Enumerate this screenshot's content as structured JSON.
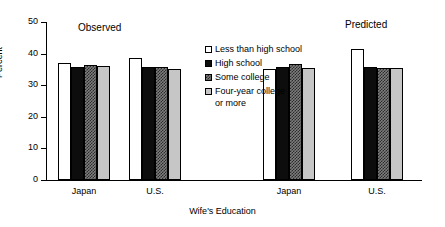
{
  "chart_data": {
    "type": "bar",
    "title": "",
    "xlabel": "Wife's Education",
    "ylabel": "Percent",
    "ylim": [
      0,
      50
    ],
    "yticks": [
      0,
      10,
      20,
      30,
      40,
      50
    ],
    "grid": false,
    "legend_position": "center-top-inside",
    "panels": [
      {
        "label": "Observed"
      },
      {
        "label": "Predicted"
      }
    ],
    "categories": [
      "Japan",
      "U.S.",
      "Japan",
      "U.S."
    ],
    "group_panels": [
      "Observed",
      "Observed",
      "Predicted",
      "Predicted"
    ],
    "series": [
      {
        "name": "Less than high school",
        "swatch": "white",
        "values": [
          37.0,
          38.6,
          35.1,
          41.6
        ]
      },
      {
        "name": "High school",
        "swatch": "black",
        "values": [
          35.8,
          35.7,
          35.7,
          35.9
        ]
      },
      {
        "name": "Some college",
        "swatch": "hatched",
        "values": [
          36.3,
          35.8,
          36.7,
          35.6
        ]
      },
      {
        "name": "Four-year college or more",
        "swatch": "light-gray",
        "values": [
          36.0,
          35.2,
          35.4,
          35.5
        ],
        "label_line1": "Four-year college",
        "label_line2": "or more"
      }
    ]
  },
  "axis": {
    "y_tick_labels": [
      "50",
      "40",
      "30",
      "20",
      "10",
      "0"
    ],
    "y_axis_title": "Percent",
    "x_axis_title": "Wife's Education",
    "group_labels": [
      "Japan",
      "U.S.",
      "Japan",
      "U.S."
    ]
  },
  "panels": {
    "observed_label": "Observed",
    "predicted_label": "Predicted"
  },
  "legend": {
    "items": [
      {
        "label": "Less than high school"
      },
      {
        "label": "High school"
      },
      {
        "label": "Some college"
      },
      {
        "label": "Four-year college",
        "label2": "or more"
      }
    ]
  }
}
